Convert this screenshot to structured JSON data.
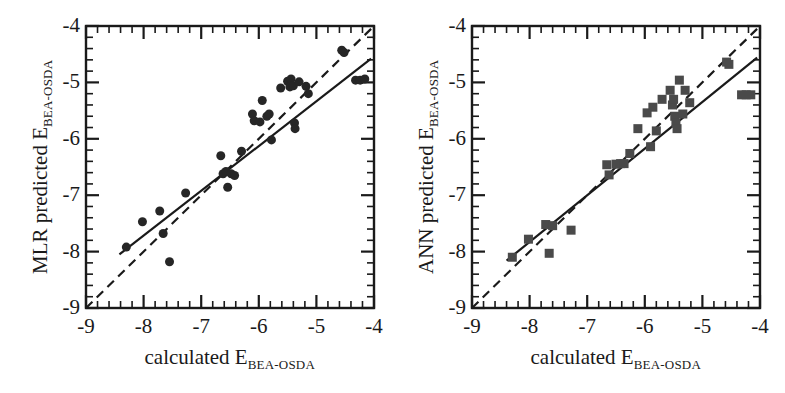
{
  "figure": {
    "panels": [
      "left",
      "right"
    ],
    "background": "#ffffff",
    "ink": "#1a1a1a"
  },
  "panel_left": {
    "y_axis_title_main": "MLR predicted E",
    "y_axis_title_sub": "BEA-OSDA",
    "x_axis_title_main": "calculated E",
    "x_axis_title_sub": "BEA-OSDA"
  },
  "panel_right": {
    "y_axis_title_main": "ANN predicted E",
    "y_axis_title_sub": "BEA-OSDA",
    "x_axis_title_main": "calculated E",
    "x_axis_title_sub": "BEA-OSDA"
  },
  "axis_ticks": {
    "x": [
      "-9",
      "-8",
      "-7",
      "-6",
      "-5",
      "-4"
    ],
    "y": [
      "-4",
      "-5",
      "-6",
      "-7",
      "-8",
      "-9"
    ]
  },
  "chart_data": [
    {
      "type": "scatter",
      "panel": "left",
      "title": "",
      "xlabel": "calculated E_BEA-OSDA",
      "ylabel": "MLR predicted E_BEA-OSDA",
      "xlim": [
        -9,
        -4
      ],
      "ylim": [
        -9,
        -4
      ],
      "xticks": [
        -9,
        -8,
        -7,
        -6,
        -5,
        -4
      ],
      "yticks": [
        -9,
        -8,
        -7,
        -6,
        -5,
        -4
      ],
      "minor_ticks_per_major": 4,
      "grid": false,
      "legend": "none",
      "marker": "circle",
      "marker_color": "#262626",
      "marker_size": 9,
      "points": [
        {
          "x": -8.3,
          "y": -7.92
        },
        {
          "x": -8.02,
          "y": -7.47
        },
        {
          "x": -7.72,
          "y": -7.28
        },
        {
          "x": -7.66,
          "y": -7.68
        },
        {
          "x": -7.55,
          "y": -8.18
        },
        {
          "x": -7.27,
          "y": -6.96
        },
        {
          "x": -6.66,
          "y": -6.3
        },
        {
          "x": -6.62,
          "y": -6.62
        },
        {
          "x": -6.57,
          "y": -6.58
        },
        {
          "x": -6.54,
          "y": -6.86
        },
        {
          "x": -6.48,
          "y": -6.62
        },
        {
          "x": -6.42,
          "y": -6.65
        },
        {
          "x": -6.3,
          "y": -6.22
        },
        {
          "x": -6.11,
          "y": -5.56
        },
        {
          "x": -6.08,
          "y": -5.68
        },
        {
          "x": -5.98,
          "y": -5.7
        },
        {
          "x": -5.94,
          "y": -5.32
        },
        {
          "x": -5.86,
          "y": -5.6
        },
        {
          "x": -5.82,
          "y": -5.56
        },
        {
          "x": -5.78,
          "y": -6.02
        },
        {
          "x": -5.62,
          "y": -5.1
        },
        {
          "x": -5.5,
          "y": -4.98
        },
        {
          "x": -5.46,
          "y": -5.08
        },
        {
          "x": -5.44,
          "y": -4.94
        },
        {
          "x": -5.4,
          "y": -5.06
        },
        {
          "x": -5.38,
          "y": -5.72
        },
        {
          "x": -5.37,
          "y": -5.82
        },
        {
          "x": -5.3,
          "y": -4.99
        },
        {
          "x": -5.18,
          "y": -5.07
        },
        {
          "x": -5.14,
          "y": -5.2
        },
        {
          "x": -4.56,
          "y": -4.43
        },
        {
          "x": -4.52,
          "y": -4.47
        },
        {
          "x": -4.32,
          "y": -4.96
        },
        {
          "x": -4.24,
          "y": -4.96
        },
        {
          "x": -4.16,
          "y": -4.94
        }
      ],
      "identity_line": {
        "style": "dashed",
        "from": [
          -9,
          -9
        ],
        "to": [
          -4,
          -4
        ]
      },
      "fit_line": {
        "style": "solid",
        "from": [
          -8.42,
          -8.05
        ],
        "to": [
          -4.05,
          -4.58
        ]
      }
    },
    {
      "type": "scatter",
      "panel": "right",
      "title": "",
      "xlabel": "calculated E_BEA-OSDA",
      "ylabel": "ANN predicted E_BEA-OSDA",
      "xlim": [
        -9,
        -4
      ],
      "ylim": [
        -9,
        -4
      ],
      "xticks": [
        -9,
        -8,
        -7,
        -6,
        -5,
        -4
      ],
      "yticks": [
        -9,
        -8,
        -7,
        -6,
        -5,
        -4
      ],
      "minor_ticks_per_major": 4,
      "grid": false,
      "legend": "none",
      "marker": "square",
      "marker_color": "#4a4a4a",
      "marker_size": 9,
      "points": [
        {
          "x": -8.3,
          "y": -8.1
        },
        {
          "x": -8.02,
          "y": -7.78
        },
        {
          "x": -7.72,
          "y": -7.52
        },
        {
          "x": -7.66,
          "y": -8.03
        },
        {
          "x": -7.6,
          "y": -7.54
        },
        {
          "x": -7.28,
          "y": -7.62
        },
        {
          "x": -6.66,
          "y": -6.46
        },
        {
          "x": -6.62,
          "y": -6.64
        },
        {
          "x": -6.5,
          "y": -6.45
        },
        {
          "x": -6.42,
          "y": -6.44
        },
        {
          "x": -6.36,
          "y": -6.44
        },
        {
          "x": -6.26,
          "y": -6.26
        },
        {
          "x": -6.12,
          "y": -5.82
        },
        {
          "x": -5.96,
          "y": -5.54
        },
        {
          "x": -5.9,
          "y": -6.14
        },
        {
          "x": -5.86,
          "y": -5.44
        },
        {
          "x": -5.8,
          "y": -5.86
        },
        {
          "x": -5.7,
          "y": -5.3
        },
        {
          "x": -5.56,
          "y": -5.14
        },
        {
          "x": -5.52,
          "y": -5.4
        },
        {
          "x": -5.5,
          "y": -5.3
        },
        {
          "x": -5.48,
          "y": -5.6
        },
        {
          "x": -5.46,
          "y": -5.72
        },
        {
          "x": -5.44,
          "y": -5.82
        },
        {
          "x": -5.4,
          "y": -4.96
        },
        {
          "x": -5.34,
          "y": -5.56
        },
        {
          "x": -5.3,
          "y": -5.14
        },
        {
          "x": -5.22,
          "y": -5.36
        },
        {
          "x": -4.58,
          "y": -4.64
        },
        {
          "x": -4.54,
          "y": -4.68
        },
        {
          "x": -4.32,
          "y": -5.22
        },
        {
          "x": -4.24,
          "y": -5.22
        },
        {
          "x": -4.16,
          "y": -5.22
        }
      ],
      "identity_line": {
        "style": "dashed",
        "from": [
          -9,
          -9
        ],
        "to": [
          -4,
          -4
        ]
      },
      "fit_line": {
        "style": "solid",
        "from": [
          -8.4,
          -8.16
        ],
        "to": [
          -4.05,
          -4.56
        ]
      }
    }
  ]
}
